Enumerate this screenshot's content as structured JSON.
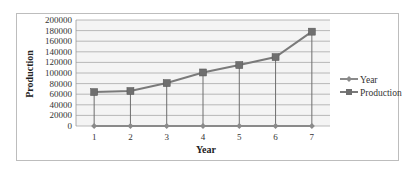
{
  "chart_data": {
    "type": "line",
    "title": "",
    "xlabel": "Year",
    "ylabel": "Production",
    "categories": [
      "1",
      "2",
      "3",
      "4",
      "5",
      "6",
      "7"
    ],
    "series": [
      {
        "name": "Year",
        "values": [
          1,
          2,
          3,
          4,
          5,
          6,
          7
        ],
        "color": "#8a8a8a",
        "marker": "diamond"
      },
      {
        "name": "Production",
        "values": [
          64000,
          66000,
          81000,
          101000,
          115000,
          130000,
          178000
        ],
        "color": "#7a7a7a",
        "marker": "square"
      }
    ],
    "ylim": [
      0,
      200000
    ],
    "yticks": [
      "0",
      "20000",
      "40000",
      "60000",
      "80000",
      "100000",
      "120000",
      "140000",
      "160000",
      "180000",
      "200000"
    ],
    "grid": true,
    "legend_position": "right",
    "drop_lines": true
  }
}
